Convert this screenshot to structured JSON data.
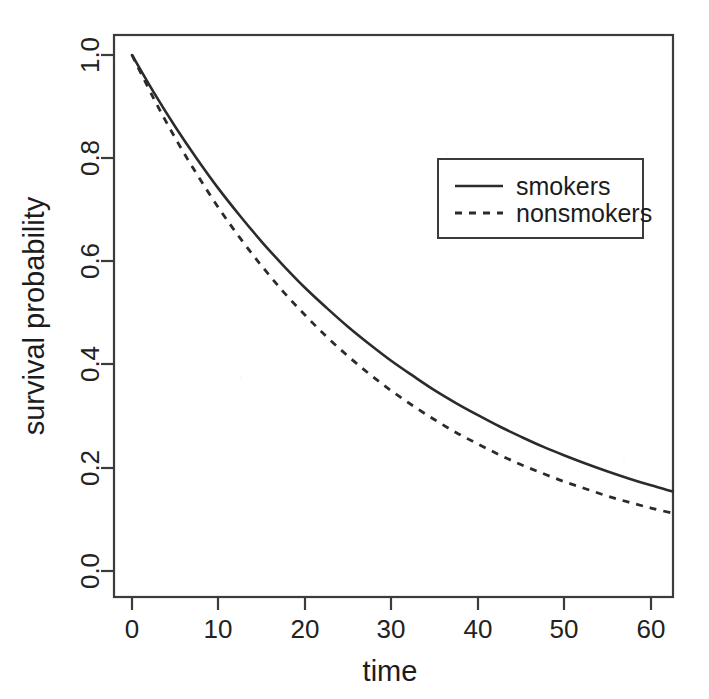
{
  "figure": {
    "background_color": "#ffffff",
    "ink_color": "#2b2b2b"
  },
  "chart_data": {
    "type": "line",
    "title": "",
    "subtitle": "",
    "xlabel": "time",
    "ylabel": "survival probability",
    "xlim": [
      -1.5,
      62.5
    ],
    "ylim": [
      -0.04,
      1.04
    ],
    "xticks": [
      0,
      10,
      20,
      30,
      40,
      50,
      60
    ],
    "xticklabels": [
      "0",
      "10",
      "20",
      "30",
      "40",
      "50",
      "60"
    ],
    "yticks": [
      0.0,
      0.2,
      0.4,
      0.6,
      0.8,
      1.0
    ],
    "yticklabels": [
      "0.0",
      "0.2",
      "0.4",
      "0.6",
      "0.8",
      "1.0"
    ],
    "grid": false,
    "legend_position": "upper right",
    "legend_entries": [
      {
        "label": "smokers",
        "linestyle": "solid"
      },
      {
        "label": "nonsmokers",
        "linestyle": "dashed"
      }
    ],
    "x": [
      0,
      2.5,
      5,
      7.5,
      10,
      12.5,
      15,
      17.5,
      20,
      22.5,
      25,
      27.5,
      30,
      32.5,
      35,
      37.5,
      40,
      42.5,
      45,
      47.5,
      50,
      52.5,
      55,
      57.5,
      60,
      62.5
    ],
    "series": [
      {
        "name": "smokers",
        "linestyle": "solid",
        "values": [
          1.0,
          0.928,
          0.861,
          0.799,
          0.741,
          0.688,
          0.638,
          0.592,
          0.549,
          0.51,
          0.473,
          0.439,
          0.407,
          0.378,
          0.35,
          0.325,
          0.302,
          0.28,
          0.26,
          0.241,
          0.224,
          0.208,
          0.193,
          0.179,
          0.166,
          0.154
        ]
      },
      {
        "name": "nonsmokers",
        "linestyle": "dashed",
        "values": [
          1.0,
          0.916,
          0.839,
          0.769,
          0.704,
          0.645,
          0.591,
          0.541,
          0.496,
          0.454,
          0.416,
          0.381,
          0.349,
          0.32,
          0.293,
          0.268,
          0.246,
          0.225,
          0.206,
          0.189,
          0.173,
          0.159,
          0.145,
          0.133,
          0.122,
          0.112
        ]
      }
    ],
    "reading_points": {
      "note": "values read off the axes at the labelled x ticks",
      "time": [
        0,
        10,
        20,
        30,
        40,
        50,
        60,
        62.5
      ],
      "smokers": [
        1.0,
        0.74,
        0.5,
        0.32,
        0.2,
        0.12,
        0.06,
        0.05
      ],
      "nonsmokers": [
        1.0,
        0.71,
        0.45,
        0.28,
        0.155,
        0.085,
        0.04,
        0.03
      ]
    }
  }
}
